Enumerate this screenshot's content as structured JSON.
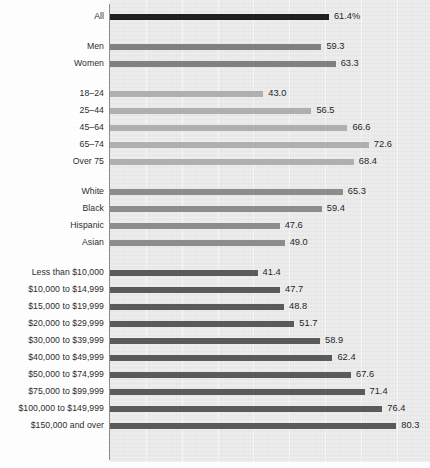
{
  "chart_data": {
    "type": "bar",
    "orientation": "horizontal",
    "title": "",
    "subtitle": "",
    "xlabel": "",
    "ylabel": "",
    "xlim": [
      0,
      89
    ],
    "grid": "vertical-faint",
    "legend": "none",
    "value_suffix_first_row": "%",
    "groups": [
      {
        "name": "total",
        "color": "#1e1e1e",
        "rows": [
          {
            "label": "All",
            "value": 61.4,
            "value_text": "61.4%"
          }
        ]
      },
      {
        "name": "sex",
        "color": "#818181",
        "rows": [
          {
            "label": "Men",
            "value": 59.3,
            "value_text": "59.3"
          },
          {
            "label": "Women",
            "value": 63.3,
            "value_text": "63.3"
          }
        ]
      },
      {
        "name": "age",
        "color": "#b0b0b0",
        "rows": [
          {
            "label": "18–24",
            "value": 43.0,
            "value_text": "43.0"
          },
          {
            "label": "25–44",
            "value": 56.5,
            "value_text": "56.5"
          },
          {
            "label": "45–64",
            "value": 66.6,
            "value_text": "66.6"
          },
          {
            "label": "65–74",
            "value": 72.6,
            "value_text": "72.6"
          },
          {
            "label": "Over 75",
            "value": 68.4,
            "value_text": "68.4"
          }
        ]
      },
      {
        "name": "race",
        "color": "#8d8d8d",
        "rows": [
          {
            "label": "White",
            "value": 65.3,
            "value_text": "65.3"
          },
          {
            "label": "Black",
            "value": 59.4,
            "value_text": "59.4"
          },
          {
            "label": "Hispanic",
            "value": 47.6,
            "value_text": "47.6"
          },
          {
            "label": "Asian",
            "value": 49.0,
            "value_text": "49.0"
          }
        ]
      },
      {
        "name": "income",
        "color": "#5a5a5a",
        "rows": [
          {
            "label": "Less than $10,000",
            "value": 41.4,
            "value_text": "41.4"
          },
          {
            "label": "$10,000 to $14,999",
            "value": 47.7,
            "value_text": "47.7"
          },
          {
            "label": "$15,000 to $19,999",
            "value": 48.8,
            "value_text": "48.8"
          },
          {
            "label": "$20,000 to $29,999",
            "value": 51.7,
            "value_text": "51.7"
          },
          {
            "label": "$30,000 to $39,999",
            "value": 58.9,
            "value_text": "58.9"
          },
          {
            "label": "$40,000 to $49,999",
            "value": 62.4,
            "value_text": "62.4"
          },
          {
            "label": "$50,000 to $74,999",
            "value": 67.6,
            "value_text": "67.6"
          },
          {
            "label": "$75,000 to $99,999",
            "value": 71.4,
            "value_text": "71.4"
          },
          {
            "label": "$100,000 to $149,999",
            "value": 76.4,
            "value_text": "76.4"
          },
          {
            "label": "$150,000 and over",
            "value": 80.3,
            "value_text": "80.3"
          }
        ]
      }
    ]
  },
  "colors": {
    "panel_background": "#ebebeb",
    "page_background": "#ffffff",
    "axis": "#8e8e8e",
    "label_text": "#2b2b2b",
    "value_text": "#1f1f1f",
    "gridline": "#f7f7f7"
  },
  "geometry": {
    "axis_x": 110,
    "px_per_unit": 3.565,
    "row_height": 13,
    "row_pitch": 17,
    "group_gap": 13,
    "first_row_top": 10
  }
}
